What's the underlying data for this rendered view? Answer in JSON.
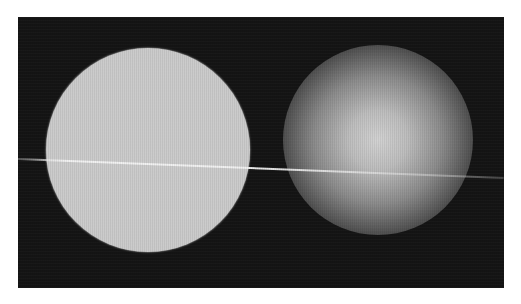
{
  "scene": {
    "canvas": {
      "width": 521,
      "height": 304,
      "background": "#ffffff"
    },
    "frame": {
      "x": 18,
      "y": 17,
      "width": 486,
      "height": 271,
      "color": "#141414"
    },
    "solid_circle": {
      "label": "sharp-edged bright disc",
      "cx": 148,
      "cy": 150,
      "r": 102,
      "color": "#cbcbcb"
    },
    "soft_circle": {
      "label": "blurred glowing disc",
      "cx": 378,
      "cy": 140,
      "r": 95,
      "center_color": "#d2d2d2",
      "edge_color": "#141414"
    },
    "line": {
      "label": "thin horizontal streak",
      "x1": 18,
      "y1": 158,
      "x2": 504,
      "y2": 177,
      "color": "#f2f2f2"
    }
  }
}
